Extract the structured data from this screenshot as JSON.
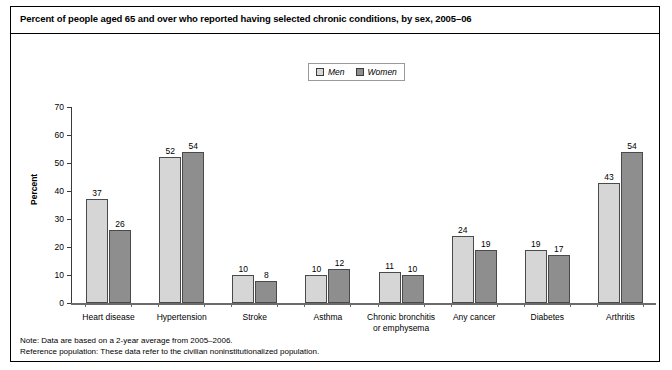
{
  "chart_data": {
    "type": "bar",
    "title": "Percent of people aged 65 and over who reported having selected chronic conditions, by sex, 2005–06",
    "xlabel": "",
    "ylabel": "Percent",
    "ylim": [
      0,
      70
    ],
    "yticks": [
      0,
      10,
      20,
      30,
      40,
      50,
      60,
      70
    ],
    "grid": false,
    "legend_position": "top-center",
    "categories": [
      "Heart disease",
      "Hypertension",
      "Stroke",
      "Asthma",
      "Chronic bronchitis or emphysema",
      "Any cancer",
      "Diabetes",
      "Arthritis"
    ],
    "category_lines": [
      [
        "Heart disease"
      ],
      [
        "Hypertension"
      ],
      [
        "Stroke"
      ],
      [
        "Asthma"
      ],
      [
        "Chronic bronchitis",
        "or emphysema"
      ],
      [
        "Any cancer"
      ],
      [
        "Diabetes"
      ],
      [
        "Arthritis"
      ]
    ],
    "series": [
      {
        "name": "Men",
        "color": "#d6d6d6",
        "values": [
          37,
          52,
          10,
          10,
          11,
          24,
          19,
          43
        ]
      },
      {
        "name": "Women",
        "color": "#8e8e8e",
        "values": [
          26,
          54,
          8,
          12,
          10,
          19,
          17,
          54
        ]
      }
    ]
  },
  "legend": {
    "items": [
      {
        "label": "Men",
        "color": "#d6d6d6"
      },
      {
        "label": "Women",
        "color": "#8e8e8e"
      }
    ]
  },
  "notes": {
    "line1": "Note: Data are based on a 2-year average from 2005–2006.",
    "line2": "Reference population: These data refer to the civilian noninstitutionalized population."
  }
}
